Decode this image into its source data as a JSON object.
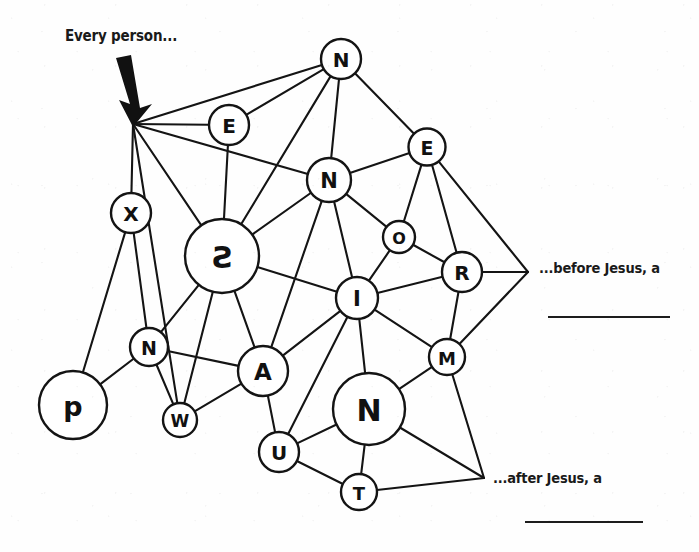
{
  "canvas": {
    "width": 699,
    "height": 552,
    "background": "#fefefe",
    "ink": "#141414"
  },
  "annotations": {
    "top_left": {
      "text": "Every person...",
      "x": 65,
      "y": 27
    },
    "right_upper": {
      "text": "...before Jesus, a",
      "x": 539,
      "y": 260
    },
    "right_lower": {
      "text": "...after Jesus, a",
      "x": 493,
      "y": 470
    },
    "blank_line_upper": {
      "x": 548,
      "y": 316,
      "width": 122
    },
    "blank_line_lower": {
      "x": 525,
      "y": 521,
      "width": 118
    }
  },
  "arrow": {
    "name": "down-arrow",
    "from_x": 122,
    "from_y": 62,
    "to_x": 133,
    "to_y": 120
  },
  "graph_data": {
    "type": "node-link-diagram",
    "nodes": [
      {
        "id": "hub_left",
        "label": "",
        "x": 133,
        "y": 124,
        "r": 0,
        "fontsize": 0,
        "hidden": true
      },
      {
        "id": "N_top",
        "label": "N",
        "x": 341,
        "y": 59,
        "r": 20,
        "fontsize": 20
      },
      {
        "id": "E_left",
        "label": "E",
        "x": 229,
        "y": 125,
        "r": 20,
        "fontsize": 20
      },
      {
        "id": "E_right",
        "label": "E",
        "x": 427,
        "y": 147,
        "r": 18.5,
        "fontsize": 19
      },
      {
        "id": "N_mid",
        "label": "N",
        "x": 329,
        "y": 180,
        "r": 22,
        "fontsize": 21
      },
      {
        "id": "X",
        "label": "X",
        "x": 131,
        "y": 213,
        "r": 20,
        "fontsize": 20
      },
      {
        "id": "S",
        "label": "S",
        "x": 222,
        "y": 256,
        "r": 37,
        "fontsize": 30,
        "mirrored": true
      },
      {
        "id": "O",
        "label": "O",
        "x": 399,
        "y": 237,
        "r": 16,
        "fontsize": 16
      },
      {
        "id": "R",
        "label": "R",
        "x": 462,
        "y": 272,
        "r": 20,
        "fontsize": 20
      },
      {
        "id": "I",
        "label": "I",
        "x": 357,
        "y": 298,
        "r": 21,
        "fontsize": 21
      },
      {
        "id": "N_small",
        "label": "N",
        "x": 149,
        "y": 347,
        "r": 19,
        "fontsize": 19
      },
      {
        "id": "M",
        "label": "M",
        "x": 447,
        "y": 357,
        "r": 18,
        "fontsize": 18
      },
      {
        "id": "A",
        "label": "A",
        "x": 263,
        "y": 371,
        "r": 25,
        "fontsize": 23
      },
      {
        "id": "p",
        "label": "p",
        "x": 73,
        "y": 405,
        "r": 34,
        "fontsize": 27
      },
      {
        "id": "W",
        "label": "W",
        "x": 180,
        "y": 420,
        "r": 17,
        "fontsize": 17
      },
      {
        "id": "N_big",
        "label": "N",
        "x": 369,
        "y": 409,
        "r": 36,
        "fontsize": 30
      },
      {
        "id": "U",
        "label": "U",
        "x": 279,
        "y": 452,
        "r": 20,
        "fontsize": 20
      },
      {
        "id": "T",
        "label": "T",
        "x": 359,
        "y": 492,
        "r": 18,
        "fontsize": 18
      },
      {
        "id": "vtx_before",
        "label": "",
        "x": 528,
        "y": 272,
        "r": 0,
        "fontsize": 0,
        "hidden": true
      },
      {
        "id": "vtx_after",
        "label": "",
        "x": 484,
        "y": 478,
        "r": 0,
        "fontsize": 0,
        "hidden": true
      }
    ],
    "edges": [
      [
        "hub_left",
        "N_top"
      ],
      [
        "hub_left",
        "E_left"
      ],
      [
        "hub_left",
        "N_mid"
      ],
      [
        "hub_left",
        "X"
      ],
      [
        "hub_left",
        "S"
      ],
      [
        "hub_left",
        "W"
      ],
      [
        "E_left",
        "N_top"
      ],
      [
        "E_left",
        "S"
      ],
      [
        "N_top",
        "N_mid"
      ],
      [
        "N_top",
        "E_right"
      ],
      [
        "N_top",
        "S"
      ],
      [
        "E_right",
        "N_mid"
      ],
      [
        "E_right",
        "O"
      ],
      [
        "E_right",
        "R"
      ],
      [
        "E_right",
        "vtx_before"
      ],
      [
        "N_mid",
        "S"
      ],
      [
        "N_mid",
        "O"
      ],
      [
        "N_mid",
        "I"
      ],
      [
        "N_mid",
        "A"
      ],
      [
        "O",
        "R"
      ],
      [
        "O",
        "I"
      ],
      [
        "R",
        "I"
      ],
      [
        "R",
        "M"
      ],
      [
        "R",
        "vtx_before"
      ],
      [
        "X",
        "p"
      ],
      [
        "X",
        "N_small"
      ],
      [
        "S",
        "N_small"
      ],
      [
        "S",
        "W"
      ],
      [
        "S",
        "A"
      ],
      [
        "S",
        "I"
      ],
      [
        "N_small",
        "p"
      ],
      [
        "N_small",
        "A"
      ],
      [
        "N_small",
        "W"
      ],
      [
        "A",
        "W"
      ],
      [
        "A",
        "I"
      ],
      [
        "A",
        "U"
      ],
      [
        "I",
        "U"
      ],
      [
        "I",
        "N_big"
      ],
      [
        "I",
        "M"
      ],
      [
        "M",
        "N_big"
      ],
      [
        "M",
        "vtx_after"
      ],
      [
        "M",
        "vtx_before"
      ],
      [
        "N_big",
        "U"
      ],
      [
        "N_big",
        "T"
      ],
      [
        "N_big",
        "vtx_after"
      ],
      [
        "U",
        "T"
      ],
      [
        "T",
        "vtx_after"
      ]
    ]
  }
}
